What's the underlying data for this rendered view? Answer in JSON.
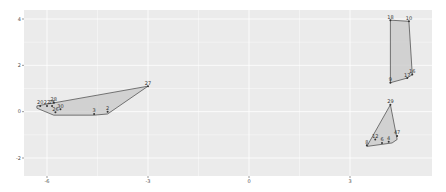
{
  "chart_data": {
    "type": "scatter",
    "title": "",
    "xlabel": "",
    "ylabel": "",
    "xlim": [
      -7.0,
      5.5
    ],
    "ylim": [
      -2.8,
      4.2
    ],
    "grid": true,
    "legend": "none",
    "x_ticks": [
      -6,
      -3,
      0,
      3
    ],
    "y_ticks": [
      -2,
      0,
      2,
      4
    ],
    "x_tick_labels": [
      "-6",
      "-3",
      "0",
      "3"
    ],
    "y_tick_labels": [
      "-2",
      "0",
      "2",
      "4"
    ],
    "colors": {
      "panel_bg": "#ebebeb",
      "grid": "#ffffff",
      "hull_fill": "#c8c8c8",
      "hull_stroke": "#555555",
      "point": "#333333",
      "tick_text": "#4d4d4d"
    },
    "clusters": [
      {
        "name": "cluster-left",
        "hull": [
          [
            -6.3,
            0.25
          ],
          [
            -3.0,
            1.1
          ],
          [
            -4.2,
            -0.1
          ],
          [
            -4.6,
            -0.15
          ],
          [
            -5.8,
            -0.15
          ],
          [
            -6.3,
            0.15
          ]
        ],
        "points": [
          {
            "label": "20",
            "x": -6.2,
            "y": 0.25
          },
          {
            "label": "22",
            "x": -6.0,
            "y": 0.25
          },
          {
            "label": "25",
            "x": -5.85,
            "y": 0.25
          },
          {
            "label": "28",
            "x": -5.8,
            "y": 0.4
          },
          {
            "label": "30",
            "x": -5.6,
            "y": 0.1
          },
          {
            "label": "26",
            "x": -5.75,
            "y": -0.02
          },
          {
            "label": "3",
            "x": -4.6,
            "y": -0.1
          },
          {
            "label": "2",
            "x": -4.2,
            "y": 0.0
          },
          {
            "label": "27",
            "x": -3.0,
            "y": 1.1
          }
        ]
      },
      {
        "name": "cluster-top-right",
        "hull": [
          [
            4.2,
            3.95
          ],
          [
            4.75,
            3.9
          ],
          [
            4.85,
            1.6
          ],
          [
            4.7,
            1.45
          ],
          [
            4.2,
            1.25
          ]
        ],
        "points": [
          {
            "label": "18",
            "x": 4.2,
            "y": 3.95
          },
          {
            "label": "10",
            "x": 4.75,
            "y": 3.9
          },
          {
            "label": "16",
            "x": 4.85,
            "y": 1.6
          },
          {
            "label": "17",
            "x": 4.7,
            "y": 1.45
          },
          {
            "label": "9",
            "x": 4.2,
            "y": 1.25
          }
        ]
      },
      {
        "name": "cluster-bottom-right",
        "hull": [
          [
            4.2,
            0.3
          ],
          [
            4.4,
            -1.2
          ],
          [
            4.25,
            -1.35
          ],
          [
            3.5,
            -1.5
          ]
        ],
        "points": [
          {
            "label": "29",
            "x": 4.2,
            "y": 0.3
          },
          {
            "label": "8",
            "x": 3.5,
            "y": -1.45
          },
          {
            "label": "12",
            "x": 3.75,
            "y": -1.2
          },
          {
            "label": "6",
            "x": 3.95,
            "y": -1.35
          },
          {
            "label": "4",
            "x": 4.15,
            "y": -1.3
          },
          {
            "label": "47",
            "x": 4.4,
            "y": -1.05
          }
        ]
      }
    ]
  }
}
